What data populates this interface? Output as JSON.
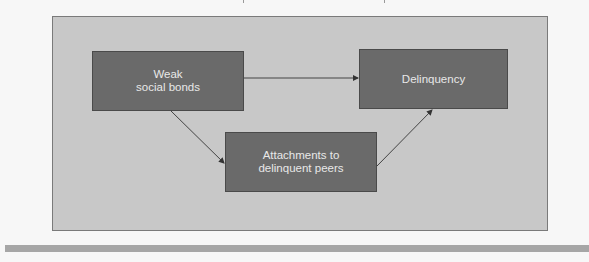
{
  "diagram": {
    "nodes": {
      "weak_social_bonds": {
        "line1": "Weak",
        "line2": "social bonds"
      },
      "delinquency": {
        "label": "Delinquency"
      },
      "attachments": {
        "line1": "Attachments to",
        "line2": "delinquent peers"
      }
    },
    "edges": [
      {
        "from": "weak_social_bonds",
        "to": "delinquency"
      },
      {
        "from": "weak_social_bonds",
        "to": "attachments"
      },
      {
        "from": "attachments",
        "to": "delinquency"
      }
    ],
    "colors": {
      "page_background": "#f7f7f7",
      "frame_fill": "#c8c8c8",
      "frame_border": "#7a7a7a",
      "node_fill": "#6a6a6a",
      "node_text": "#e8e8e8",
      "arrow": "#333333",
      "bottom_bar": "#a6a6a6"
    }
  }
}
